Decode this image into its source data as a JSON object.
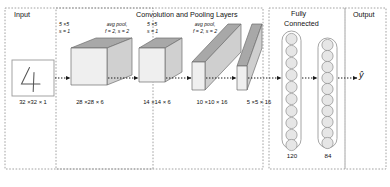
{
  "diagram": {
    "sections": {
      "input": "Input",
      "conv": "Convolution and Pooling Layers",
      "fc_line1": "Fully",
      "fc_line2": "Connected",
      "output": "Output"
    },
    "input_block": {
      "glyph": "4",
      "dim": "32 ×32 × 1"
    },
    "hyperparams": [
      {
        "line1": "5 ×5",
        "line2": "s = 1"
      },
      {
        "line1": "avg pool,",
        "line2": "f = 2, s = 2"
      },
      {
        "line1": "5 ×5",
        "line2": "s = 1"
      },
      {
        "line1": "avg pool,",
        "line2": "f = 2, s = 2"
      }
    ],
    "volumes": [
      {
        "dim": "28 ×28 × 6"
      },
      {
        "dim": "14 ×14 × 6"
      },
      {
        "dim": "10 ×10 × 16"
      },
      {
        "dim": "5 ×5 × 16"
      }
    ],
    "fc_layers": [
      {
        "label": "120",
        "units": 10
      },
      {
        "label": "84",
        "units": 10
      }
    ],
    "output_symbol": "ŷ",
    "colors": {
      "top_face": "#a8a8a8",
      "front_face": "#ececec",
      "side_face": "#d4d4d4",
      "stroke": "#6e6e6e",
      "dash": "#7a7a7a",
      "arrow": "#1a1a1a"
    }
  }
}
